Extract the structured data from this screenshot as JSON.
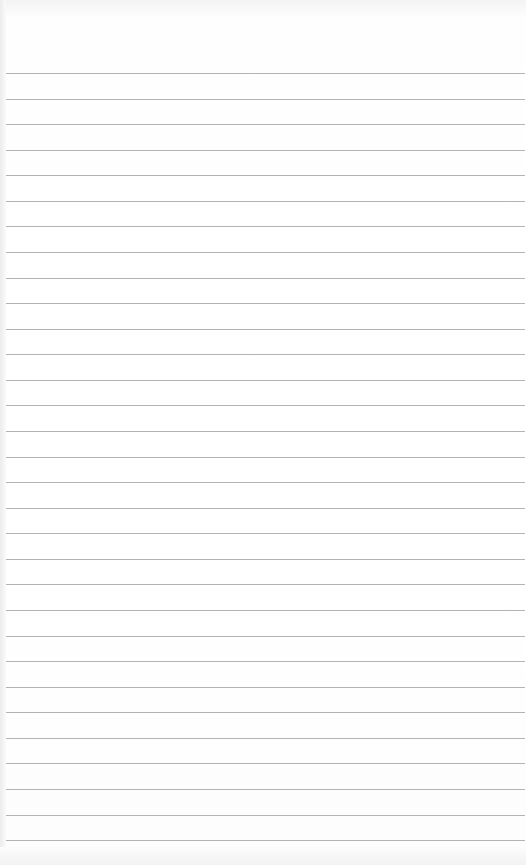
{
  "paper": {
    "type": "lined-paper",
    "line_count": 31,
    "first_line_y": 73,
    "line_spacing": 25.57,
    "line_color": "#9a9a9a",
    "background_color": "#ffffff"
  }
}
